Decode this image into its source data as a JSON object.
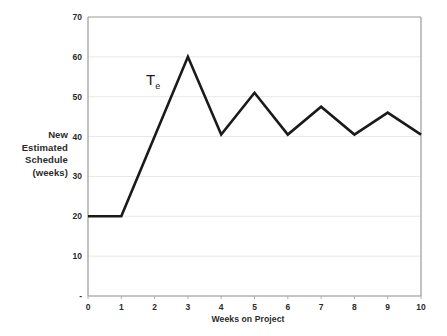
{
  "chart_data": {
    "type": "line",
    "title": "",
    "xlabel": "Weeks on Project",
    "ylabel": "New Estimated Schedule (weeks)",
    "ylabel_lines": [
      "New",
      "Estimated",
      "Schedule",
      "(weeks)"
    ],
    "x": [
      0,
      1,
      2,
      3,
      4,
      5,
      6,
      7,
      8,
      9,
      10
    ],
    "values": [
      20,
      20,
      40,
      60,
      40.5,
      51,
      40.5,
      47.5,
      40.5,
      46,
      40.5
    ],
    "series": [
      {
        "name": "Te",
        "values": [
          20,
          20,
          40,
          60,
          40.5,
          51,
          40.5,
          47.5,
          40.5,
          46,
          40.5
        ]
      }
    ],
    "annotations": [
      {
        "text": "T",
        "subscript": "e",
        "x": 2.1,
        "y": 53
      }
    ],
    "xlim": [
      0,
      10
    ],
    "ylim": [
      0,
      70
    ],
    "xticks": [
      "0",
      "1",
      "2",
      "3",
      "4",
      "5",
      "6",
      "7",
      "8",
      "9",
      "10"
    ],
    "yticks": [
      "70",
      "60",
      "50",
      "40",
      "30",
      "20",
      "10",
      "-"
    ],
    "ytick_values": [
      70,
      60,
      50,
      40,
      30,
      20,
      10,
      0
    ],
    "grid": "horizontal",
    "legend": "none",
    "line_color": "#1a1a1a",
    "grid_color": "#e8e8e8",
    "axis_color": "#8c8c8c",
    "text_color": "#2b2b2b"
  }
}
